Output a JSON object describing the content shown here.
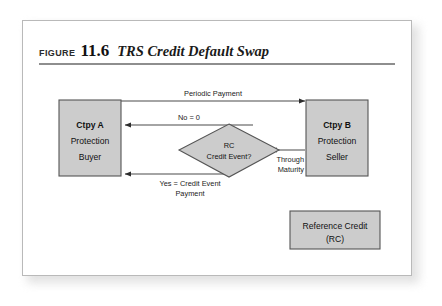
{
  "figure": {
    "label": "FIGURE",
    "number": "11.6",
    "title": "TRS Credit Default Swap"
  },
  "nodes": {
    "ctpy_a": {
      "line1": "Ctpy A",
      "line2": "Protection",
      "line3": "Buyer"
    },
    "ctpy_b": {
      "line1": "Ctpy B",
      "line2": "Protection",
      "line3": "Seller"
    },
    "decision": {
      "line1": "RC",
      "line2": "Credit Event?"
    },
    "reference_credit": {
      "line1": "Reference Credit",
      "line2": "(RC)"
    }
  },
  "edges": {
    "periodic_payment": "Periodic Payment",
    "no_zero": "No = 0",
    "yes_credit_event_1": "Yes = Credit Event",
    "yes_credit_event_2": "Payment",
    "through_1": "Through",
    "through_2": "Maturity"
  },
  "colors": {
    "shape_fill": "#cccccc",
    "shape_stroke": "#555555",
    "connector": "#4a4a4a",
    "rule": "#8e8e8e",
    "frame": "#b9b9b9"
  }
}
